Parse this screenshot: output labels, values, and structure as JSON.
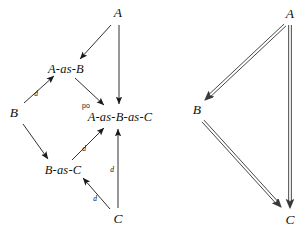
{
  "figure": {
    "type": "commutative-diagram-pair",
    "background_color": "#ffffff",
    "ink_color": "#1a1a1a"
  },
  "left_diagram": {
    "name": "pushout-diagram",
    "nodes": [
      {
        "id": "A",
        "label": "A",
        "x": 118,
        "y": 13,
        "kind": "object"
      },
      {
        "id": "A-as-B",
        "label": "A-as-B",
        "x": 66,
        "y": 69,
        "kind": "composite"
      },
      {
        "id": "B",
        "label": "B",
        "x": 14,
        "y": 113,
        "kind": "object"
      },
      {
        "id": "A-as-B-as-C",
        "label": "A-as-B-as-C",
        "x": 120,
        "y": 117,
        "kind": "composite"
      },
      {
        "id": "B-as-C",
        "label": "B-as-C",
        "x": 63,
        "y": 170,
        "kind": "composite"
      },
      {
        "id": "C",
        "label": "C",
        "x": 118,
        "y": 219,
        "kind": "object"
      }
    ],
    "edges": [
      {
        "from": "A",
        "to": "A-as-B",
        "label": "",
        "x1": 111,
        "y1": 25,
        "x2": 80,
        "y2": 59
      },
      {
        "from": "A",
        "to": "A-as-B-as-C",
        "label": "",
        "x1": 119,
        "y1": 25,
        "x2": 119,
        "y2": 104
      },
      {
        "from": "B",
        "to": "A-as-B",
        "label": "d",
        "x1": 24,
        "y1": 103,
        "x2": 54,
        "y2": 76,
        "lx": 36,
        "ly": 94
      },
      {
        "from": "A-as-B",
        "to": "A-as-B-as-C",
        "label": "po",
        "x1": 75,
        "y1": 78,
        "x2": 104,
        "y2": 105,
        "lx": 86,
        "ly": 105
      },
      {
        "from": "B",
        "to": "B-as-C",
        "label": "",
        "x1": 23,
        "y1": 124,
        "x2": 48,
        "y2": 159
      },
      {
        "from": "B-as-C",
        "to": "A-as-B-as-C",
        "label": "d",
        "x1": 72,
        "y1": 160,
        "x2": 104,
        "y2": 128,
        "lx": 84,
        "ly": 149
      },
      {
        "from": "C",
        "to": "B-as-C",
        "label": "d",
        "x1": 110,
        "y1": 209,
        "x2": 83,
        "y2": 178,
        "lx": 95,
        "ly": 199
      },
      {
        "from": "C",
        "to": "A-as-B-as-C",
        "label": "d",
        "x1": 118,
        "y1": 208,
        "x2": 118,
        "y2": 129,
        "lx": 112,
        "ly": 170
      }
    ]
  },
  "right_diagram": {
    "name": "triangle-diagram",
    "arrow_style": "double-line",
    "nodes": [
      {
        "id": "A",
        "label": "A",
        "x": 290,
        "y": 14,
        "kind": "object"
      },
      {
        "id": "B",
        "label": "B",
        "x": 197,
        "y": 110,
        "kind": "object"
      },
      {
        "id": "C",
        "label": "C",
        "x": 290,
        "y": 220,
        "kind": "object"
      }
    ],
    "edges": [
      {
        "from": "A",
        "to": "B",
        "x1": 285,
        "y1": 25,
        "x2": 205,
        "y2": 100
      },
      {
        "from": "A",
        "to": "C",
        "x1": 290,
        "y1": 25,
        "x2": 290,
        "y2": 208
      },
      {
        "from": "B",
        "to": "C",
        "x1": 203,
        "y1": 121,
        "x2": 281,
        "y2": 207
      }
    ]
  }
}
